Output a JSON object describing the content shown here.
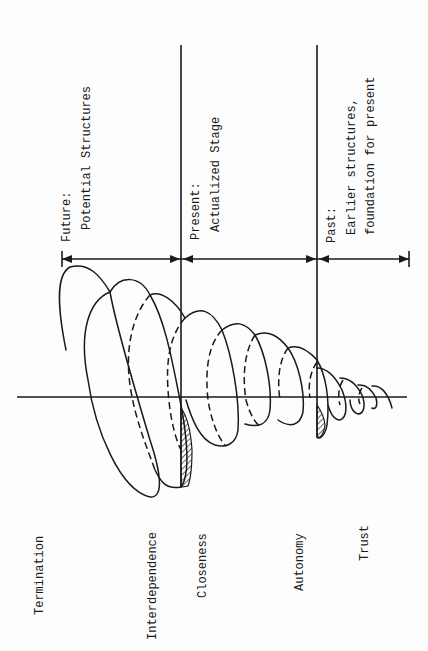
{
  "diagram": {
    "type": "spiral-development-model",
    "orientation": "rotated-90-ccw",
    "time_segments": [
      {
        "key": "future",
        "heading": "Future:",
        "lines": [
          "Potential Structures"
        ]
      },
      {
        "key": "present",
        "heading": "Present:",
        "lines": [
          "Actualized Stage"
        ]
      },
      {
        "key": "past",
        "heading": "Past:",
        "lines": [
          "Earlier structures,",
          "foundation for present"
        ]
      }
    ],
    "stages": [
      {
        "label": "Termination"
      },
      {
        "label": "Interdependence"
      },
      {
        "label": "Closeness"
      },
      {
        "label": "Autonomy"
      },
      {
        "label": "Trust"
      }
    ],
    "colors": {
      "ink": "#1a1a1a",
      "paper": "#fdfdfd"
    }
  }
}
